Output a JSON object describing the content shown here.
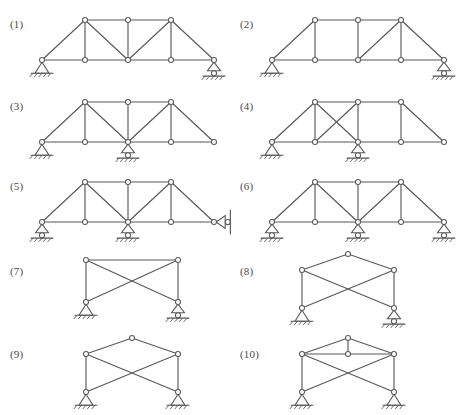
{
  "sheet": {
    "title": "Truss stability and determinacy figure set",
    "background_color": "#ffffff",
    "line_color": "#595959",
    "joint_fill": "#ffffff",
    "label_color": "#4a4a4a",
    "width": 457,
    "height": 415
  },
  "figures": [
    {
      "id": "1",
      "label": "(1)",
      "label_x": 10,
      "label_y": 18,
      "origin_x": 36,
      "origin_y": 8,
      "description": "Parallel-chord truss with inclined end posts, three verticals and four diagonals; pin support at left bottom end, roller support at right bottom end.",
      "span": 172,
      "panel_count": 4,
      "nodes": [
        {
          "name": "bottom-left-support",
          "x": 6,
          "y": 52
        },
        {
          "name": "bottom-1",
          "x": 49,
          "y": 52
        },
        {
          "name": "bottom-mid",
          "x": 92,
          "y": 52
        },
        {
          "name": "bottom-3",
          "x": 135,
          "y": 52
        },
        {
          "name": "bottom-right-support",
          "x": 178,
          "y": 52
        },
        {
          "name": "top-left",
          "x": 49,
          "y": 12
        },
        {
          "name": "top-mid",
          "x": 92,
          "y": 12
        },
        {
          "name": "top-right",
          "x": 135,
          "y": 12
        }
      ],
      "members": [
        [
          0,
          1
        ],
        [
          1,
          2
        ],
        [
          2,
          3
        ],
        [
          3,
          4
        ],
        [
          5,
          6
        ],
        [
          6,
          7
        ],
        [
          0,
          5
        ],
        [
          4,
          7
        ],
        [
          1,
          5
        ],
        [
          2,
          6
        ],
        [
          3,
          7
        ],
        [
          5,
          2
        ],
        [
          2,
          7
        ]
      ],
      "supports": [
        {
          "type": "pin",
          "node": 0
        },
        {
          "type": "roller",
          "node": 4
        }
      ]
    },
    {
      "id": "2",
      "label": "(2)",
      "label_x": 240,
      "label_y": 18,
      "origin_x": 266,
      "origin_y": 8,
      "description": "Parallel-chord truss with inclined end posts, three verticals and only one interior diagonal in the third panel; pin support at left bottom end, roller support at right bottom end.",
      "span": 172,
      "panel_count": 4,
      "nodes": [
        {
          "name": "bottom-left-support",
          "x": 6,
          "y": 52
        },
        {
          "name": "bottom-1",
          "x": 49,
          "y": 52
        },
        {
          "name": "bottom-mid",
          "x": 92,
          "y": 52
        },
        {
          "name": "bottom-3",
          "x": 135,
          "y": 52
        },
        {
          "name": "bottom-right-support",
          "x": 178,
          "y": 52
        },
        {
          "name": "top-left",
          "x": 49,
          "y": 12
        },
        {
          "name": "top-mid",
          "x": 92,
          "y": 12
        },
        {
          "name": "top-right",
          "x": 135,
          "y": 12
        }
      ],
      "members": [
        [
          0,
          1
        ],
        [
          1,
          2
        ],
        [
          2,
          3
        ],
        [
          3,
          4
        ],
        [
          5,
          6
        ],
        [
          6,
          7
        ],
        [
          0,
          5
        ],
        [
          4,
          7
        ],
        [
          1,
          5
        ],
        [
          2,
          6
        ],
        [
          3,
          7
        ],
        [
          2,
          7
        ]
      ],
      "supports": [
        {
          "type": "pin",
          "node": 0
        },
        {
          "type": "roller",
          "node": 4
        }
      ]
    },
    {
      "id": "3",
      "label": "(3)",
      "label_x": 10,
      "label_y": 100,
      "origin_x": 36,
      "origin_y": 90,
      "description": "Same truss geometry as figure 1 but supported by a pin at the left bottom end and a roller at the middle bottom joint, leaving the right end unsupported.",
      "span": 172,
      "panel_count": 4,
      "nodes": [
        {
          "name": "bottom-left-support",
          "x": 6,
          "y": 52
        },
        {
          "name": "bottom-1",
          "x": 49,
          "y": 52
        },
        {
          "name": "bottom-mid",
          "x": 92,
          "y": 52
        },
        {
          "name": "bottom-3",
          "x": 135,
          "y": 52
        },
        {
          "name": "bottom-right-end",
          "x": 178,
          "y": 52
        },
        {
          "name": "top-left",
          "x": 49,
          "y": 12
        },
        {
          "name": "top-mid",
          "x": 92,
          "y": 12
        },
        {
          "name": "top-right",
          "x": 135,
          "y": 12
        }
      ],
      "members": [
        [
          0,
          1
        ],
        [
          1,
          2
        ],
        [
          2,
          3
        ],
        [
          3,
          4
        ],
        [
          5,
          6
        ],
        [
          6,
          7
        ],
        [
          0,
          5
        ],
        [
          4,
          7
        ],
        [
          1,
          5
        ],
        [
          2,
          6
        ],
        [
          3,
          7
        ],
        [
          5,
          2
        ],
        [
          2,
          7
        ]
      ],
      "supports": [
        {
          "type": "pin",
          "node": 0
        },
        {
          "type": "roller",
          "node": 2
        }
      ]
    },
    {
      "id": "4",
      "label": "(4)",
      "label_x": 240,
      "label_y": 100,
      "origin_x": 266,
      "origin_y": 90,
      "description": "Parallel-chord truss with inclined end posts, cross bracing in the second panel, an empty third panel, pin support at the left bottom end and roller support at the middle bottom joint.",
      "span": 172,
      "panel_count": 4,
      "nodes": [
        {
          "name": "bottom-left-support",
          "x": 6,
          "y": 52
        },
        {
          "name": "bottom-1",
          "x": 49,
          "y": 52
        },
        {
          "name": "bottom-mid",
          "x": 92,
          "y": 52
        },
        {
          "name": "bottom-3",
          "x": 135,
          "y": 52
        },
        {
          "name": "bottom-right-end",
          "x": 178,
          "y": 52
        },
        {
          "name": "top-left",
          "x": 49,
          "y": 12
        },
        {
          "name": "top-mid",
          "x": 92,
          "y": 12
        },
        {
          "name": "top-right",
          "x": 135,
          "y": 12
        }
      ],
      "members": [
        [
          0,
          1
        ],
        [
          1,
          2
        ],
        [
          2,
          3
        ],
        [
          3,
          4
        ],
        [
          5,
          6
        ],
        [
          6,
          7
        ],
        [
          0,
          5
        ],
        [
          4,
          7
        ],
        [
          1,
          5
        ],
        [
          2,
          6
        ],
        [
          3,
          7
        ],
        [
          5,
          2
        ],
        [
          1,
          6
        ]
      ],
      "supports": [
        {
          "type": "pin",
          "node": 0
        },
        {
          "type": "roller",
          "node": 2
        }
      ]
    },
    {
      "id": "5",
      "label": "(5)",
      "label_x": 10,
      "label_y": 180,
      "origin_x": 36,
      "origin_y": 170,
      "description": "Same truss geometry as figure 1 with roller supports at the left bottom end and the middle bottom joint, and a horizontal link support bearing on a vertical wall at the right bottom end.",
      "span": 172,
      "panel_count": 4,
      "nodes": [
        {
          "name": "bottom-left-support",
          "x": 6,
          "y": 52
        },
        {
          "name": "bottom-1",
          "x": 49,
          "y": 52
        },
        {
          "name": "bottom-mid",
          "x": 92,
          "y": 52
        },
        {
          "name": "bottom-3",
          "x": 135,
          "y": 52
        },
        {
          "name": "bottom-right-support",
          "x": 178,
          "y": 52
        },
        {
          "name": "top-left",
          "x": 49,
          "y": 12
        },
        {
          "name": "top-mid",
          "x": 92,
          "y": 12
        },
        {
          "name": "top-right",
          "x": 135,
          "y": 12
        }
      ],
      "members": [
        [
          0,
          1
        ],
        [
          1,
          2
        ],
        [
          2,
          3
        ],
        [
          3,
          4
        ],
        [
          5,
          6
        ],
        [
          6,
          7
        ],
        [
          0,
          5
        ],
        [
          4,
          7
        ],
        [
          1,
          5
        ],
        [
          2,
          6
        ],
        [
          3,
          7
        ],
        [
          5,
          2
        ],
        [
          2,
          7
        ]
      ],
      "supports": [
        {
          "type": "roller",
          "node": 0
        },
        {
          "type": "roller",
          "node": 2
        },
        {
          "type": "wall-link",
          "node": 4
        }
      ]
    },
    {
      "id": "6",
      "label": "(6)",
      "label_x": 240,
      "label_y": 180,
      "origin_x": 266,
      "origin_y": 170,
      "description": "Same truss geometry as figure 1 supported by three roller supports at the left bottom end, the middle bottom joint and the right bottom end.",
      "span": 172,
      "panel_count": 4,
      "nodes": [
        {
          "name": "bottom-left-support",
          "x": 6,
          "y": 52
        },
        {
          "name": "bottom-1",
          "x": 49,
          "y": 52
        },
        {
          "name": "bottom-mid",
          "x": 92,
          "y": 52
        },
        {
          "name": "bottom-3",
          "x": 135,
          "y": 52
        },
        {
          "name": "bottom-right-support",
          "x": 178,
          "y": 52
        },
        {
          "name": "top-left",
          "x": 49,
          "y": 12
        },
        {
          "name": "top-mid",
          "x": 92,
          "y": 12
        },
        {
          "name": "top-right",
          "x": 135,
          "y": 12
        }
      ],
      "members": [
        [
          0,
          1
        ],
        [
          1,
          2
        ],
        [
          2,
          3
        ],
        [
          3,
          4
        ],
        [
          5,
          6
        ],
        [
          6,
          7
        ],
        [
          0,
          5
        ],
        [
          4,
          7
        ],
        [
          1,
          5
        ],
        [
          2,
          6
        ],
        [
          3,
          7
        ],
        [
          5,
          2
        ],
        [
          2,
          7
        ]
      ],
      "supports": [
        {
          "type": "roller",
          "node": 0
        },
        {
          "type": "roller",
          "node": 2
        },
        {
          "type": "roller",
          "node": 4
        }
      ]
    },
    {
      "id": "7",
      "label": "(7)",
      "label_x": 10,
      "label_y": 265,
      "origin_x": 80,
      "origin_y": 252,
      "description": "Single rectangular panel with a top chord, two side verticals and cross diagonals but no bottom chord; pin support at the bottom left and roller support at the bottom right.",
      "span": 92,
      "panel_count": 1,
      "nodes": [
        {
          "name": "bottom-left-support",
          "x": 6,
          "y": 50
        },
        {
          "name": "bottom-right-support",
          "x": 98,
          "y": 50
        },
        {
          "name": "top-left",
          "x": 6,
          "y": 8
        },
        {
          "name": "top-right",
          "x": 98,
          "y": 8
        }
      ],
      "members": [
        [
          2,
          3
        ],
        [
          0,
          2
        ],
        [
          1,
          3
        ],
        [
          0,
          3
        ],
        [
          1,
          2
        ]
      ],
      "supports": [
        {
          "type": "pin",
          "node": 0
        },
        {
          "type": "roller",
          "node": 1
        }
      ]
    },
    {
      "id": "8",
      "label": "(8)",
      "label_x": 240,
      "label_y": 265,
      "origin_x": 296,
      "origin_y": 248,
      "description": "Cross braced panel with no bottom chord topped by a peak joint connected to both upper side joints; pin support at the bottom left and roller support at the bottom right.",
      "span": 92,
      "panel_count": 1,
      "nodes": [
        {
          "name": "bottom-left-support",
          "x": 6,
          "y": 60
        },
        {
          "name": "bottom-right-support",
          "x": 98,
          "y": 60
        },
        {
          "name": "upper-left",
          "x": 6,
          "y": 22
        },
        {
          "name": "upper-right",
          "x": 98,
          "y": 22
        },
        {
          "name": "apex",
          "x": 52,
          "y": 6
        }
      ],
      "members": [
        [
          0,
          2
        ],
        [
          1,
          3
        ],
        [
          0,
          3
        ],
        [
          1,
          2
        ],
        [
          2,
          4
        ],
        [
          3,
          4
        ]
      ],
      "supports": [
        {
          "type": "pin",
          "node": 0
        },
        {
          "type": "roller",
          "node": 1
        }
      ]
    },
    {
      "id": "9",
      "label": "(9)",
      "label_x": 10,
      "label_y": 348,
      "origin_x": 80,
      "origin_y": 332,
      "description": "Cross braced panel with no bottom chord topped by a peak joint connected to both upper side joints; pin supports at both the bottom left and bottom right.",
      "span": 92,
      "panel_count": 1,
      "nodes": [
        {
          "name": "bottom-left-support",
          "x": 6,
          "y": 60
        },
        {
          "name": "bottom-right-support",
          "x": 98,
          "y": 60
        },
        {
          "name": "upper-left",
          "x": 6,
          "y": 22
        },
        {
          "name": "upper-right",
          "x": 98,
          "y": 22
        },
        {
          "name": "apex",
          "x": 52,
          "y": 6
        }
      ],
      "members": [
        [
          0,
          2
        ],
        [
          1,
          3
        ],
        [
          0,
          3
        ],
        [
          1,
          2
        ],
        [
          2,
          4
        ],
        [
          3,
          4
        ]
      ],
      "supports": [
        {
          "type": "pin",
          "node": 0
        },
        {
          "type": "pin",
          "node": 1
        }
      ]
    },
    {
      "id": "10",
      "label": "(10)",
      "label_x": 240,
      "label_y": 348,
      "origin_x": 296,
      "origin_y": 332,
      "description": "Cross braced panel with no bottom chord, a peak joint above, plus a horizontal chord between the upper side joints carrying a middle joint that is linked vertically to the peak; pin supports at both bottom corners.",
      "span": 92,
      "panel_count": 1,
      "nodes": [
        {
          "name": "bottom-left-support",
          "x": 6,
          "y": 60
        },
        {
          "name": "bottom-right-support",
          "x": 98,
          "y": 60
        },
        {
          "name": "upper-left",
          "x": 6,
          "y": 22
        },
        {
          "name": "upper-right",
          "x": 98,
          "y": 22
        },
        {
          "name": "apex",
          "x": 52,
          "y": 6
        },
        {
          "name": "upper-mid",
          "x": 52,
          "y": 22
        }
      ],
      "members": [
        [
          0,
          2
        ],
        [
          1,
          3
        ],
        [
          0,
          3
        ],
        [
          1,
          2
        ],
        [
          2,
          4
        ],
        [
          3,
          4
        ],
        [
          2,
          5
        ],
        [
          5,
          3
        ],
        [
          5,
          4
        ]
      ],
      "supports": [
        {
          "type": "pin",
          "node": 0
        },
        {
          "type": "pin",
          "node": 1
        }
      ]
    }
  ]
}
